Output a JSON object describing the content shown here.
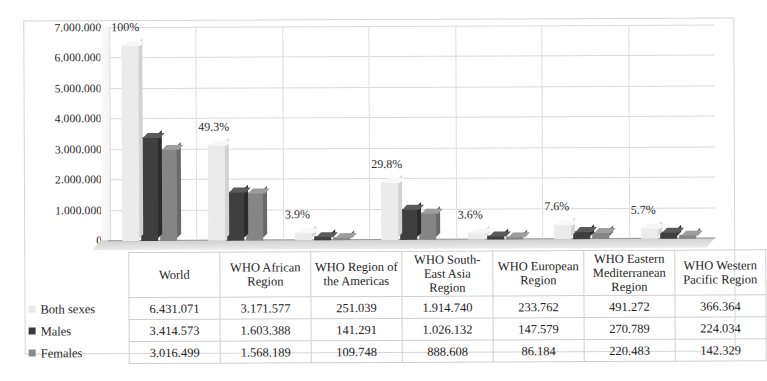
{
  "chart_data": {
    "type": "bar",
    "title": "",
    "xlabel": "",
    "ylabel": "",
    "ylim": [
      0,
      7000000
    ],
    "ytick_labels": [
      "7.000.000",
      "6.000.000",
      "5.000.000",
      "4.000.000",
      "3.000.000",
      "2.000.000",
      "1.000.000",
      "0"
    ],
    "ytick_values": [
      7000000,
      6000000,
      5000000,
      4000000,
      3000000,
      2000000,
      1000000,
      0
    ],
    "grid": true,
    "legend_position": "table-row-labels",
    "categories": [
      "World",
      "WHO African Region",
      "WHO Region of the Americas",
      "WHO South-East Asia Region",
      "WHO European Region",
      "WHO Eastern Mediterranean Region",
      "WHO Western Pacific Region"
    ],
    "annotations": [
      "100%",
      "49.3%",
      "3.9%",
      "29.8%",
      "3.6%",
      "7.6%",
      "5.7%"
    ],
    "series": [
      {
        "name": "Both sexes",
        "color": "#ebebeb",
        "values": [
          6431071,
          3171577,
          251039,
          1914740,
          233762,
          491272,
          366364
        ]
      },
      {
        "name": "Males",
        "color": "#3f3f3f",
        "values": [
          3414573,
          1603388,
          141291,
          1026132,
          147579,
          270789,
          224034
        ]
      },
      {
        "name": "Females",
        "color": "#858585",
        "values": [
          3016499,
          1568189,
          109748,
          888608,
          86184,
          220483,
          142329
        ]
      }
    ]
  },
  "table": {
    "corner": "",
    "column_headers": [
      "World",
      "WHO African Region",
      "WHO Region of the Americas",
      "WHO South-East Asia Region",
      "WHO European Region",
      "WHO Eastern Mediterranean Region",
      "WHO Western Pacific Region"
    ],
    "rows": [
      {
        "label": "Both sexes",
        "swatch": "swatch-both-sexes",
        "values": [
          "6.431.071",
          "3.171.577",
          "251.039",
          "1.914.740",
          "233.762",
          "491.272",
          "366.364"
        ]
      },
      {
        "label": "Males",
        "swatch": "swatch-males",
        "values": [
          "3.414.573",
          "1.603.388",
          "141.291",
          "1.026.132",
          "147.579",
          "270.789",
          "224.034"
        ]
      },
      {
        "label": "Females",
        "swatch": "swatch-females",
        "values": [
          "3.016.499",
          "1.568.189",
          "109.748",
          "888.608",
          "86.184",
          "220.483",
          "142.329"
        ]
      }
    ]
  }
}
